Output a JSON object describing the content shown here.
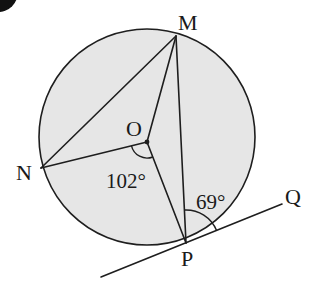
{
  "diagram": {
    "type": "circle-geometry",
    "colors": {
      "circle_fill": "#e6e6e6",
      "stroke": "#1e1e1e",
      "background": "#ffffff",
      "badge": "#111111"
    },
    "circle": {
      "center": "O",
      "cx": 147,
      "cy": 137,
      "r": 108
    },
    "points": {
      "M": {
        "label": "M",
        "x": 176,
        "y": 36
      },
      "N": {
        "label": "N",
        "x": 41,
        "y": 168
      },
      "O": {
        "label": "O",
        "x": 147,
        "y": 142
      },
      "P": {
        "label": "P",
        "x": 186,
        "y": 243
      },
      "Q": {
        "label": "Q",
        "x": 282,
        "y": 204
      }
    },
    "segments": [
      "NM",
      "NO",
      "OM",
      "OP",
      "MP",
      "NP"
    ],
    "tangent": {
      "through": "P",
      "end_label": "Q",
      "from": [
        101,
        277
      ],
      "to": [
        282,
        204
      ]
    },
    "angles": {
      "NOP": {
        "label": "102°",
        "vertex": "O",
        "value": 102
      },
      "MPQ": {
        "label": "69°",
        "vertex": "P",
        "value": 69
      }
    }
  }
}
